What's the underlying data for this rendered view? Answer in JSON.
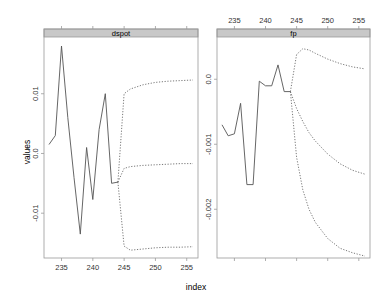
{
  "chart_data": [
    {
      "type": "line",
      "panel": "dspot",
      "xlabel": "index",
      "ylabel": "values",
      "xlim": [
        232.2,
        256.8
      ],
      "ylim": [
        -0.0175,
        0.0195
      ],
      "x_ticks": [
        235,
        240,
        245,
        250,
        255
      ],
      "x_tick_labels": [
        "235",
        "240",
        "245",
        "250",
        "255"
      ],
      "x_tick_side": "bottom",
      "y_ticks": [
        -0.01,
        0.0,
        0.01
      ],
      "y_tick_labels": [
        "-0.01",
        "0.0",
        "0.01"
      ],
      "series": [
        {
          "name": "observed",
          "style": "solid",
          "x": [
            233,
            234,
            235,
            236,
            237,
            238,
            239,
            240,
            241,
            242,
            243,
            244
          ],
          "values": [
            0.0015,
            0.003,
            0.018,
            0.006,
            -0.004,
            -0.0135,
            0.001,
            -0.0077,
            0.004,
            0.01,
            -0.005,
            -0.0048
          ]
        },
        {
          "name": "forecast-upper",
          "style": "dotted",
          "x": [
            244,
            245,
            246,
            248,
            250,
            252,
            254,
            256
          ],
          "values": [
            -0.0048,
            0.01,
            0.0108,
            0.0115,
            0.0119,
            0.0121,
            0.0122,
            0.0123
          ]
        },
        {
          "name": "forecast-mean",
          "style": "dotted",
          "x": [
            244,
            245,
            246,
            248,
            250,
            252,
            254,
            256
          ],
          "values": [
            -0.0048,
            -0.0025,
            -0.0022,
            -0.002,
            -0.0019,
            -0.0018,
            -0.0017,
            -0.0017
          ]
        },
        {
          "name": "forecast-lower",
          "style": "dotted",
          "x": [
            244,
            245,
            246,
            248,
            250,
            252,
            254,
            256
          ],
          "values": [
            -0.0048,
            -0.0155,
            -0.0162,
            -0.016,
            -0.0158,
            -0.0157,
            -0.0157,
            -0.0156
          ]
        }
      ]
    },
    {
      "type": "line",
      "panel": "fp",
      "xlabel": "index",
      "ylabel": "values",
      "xlim": [
        232.2,
        256.8
      ],
      "ylim": [
        -0.00275,
        0.00065
      ],
      "x_ticks": [
        235,
        240,
        245,
        250,
        255
      ],
      "x_tick_labels": [
        "235",
        "240",
        "245",
        "250",
        "255"
      ],
      "x_tick_side": "top",
      "y_ticks": [
        -0.002,
        -0.001,
        0.0
      ],
      "y_tick_labels": [
        "-0.002",
        "-0.001",
        "0.0"
      ],
      "series": [
        {
          "name": "observed",
          "style": "solid",
          "x": [
            233,
            234,
            235,
            236,
            237,
            238,
            239,
            240,
            241,
            242,
            243,
            244
          ],
          "values": [
            -0.0007,
            -0.00087,
            -0.00084,
            -0.00037,
            -0.00162,
            -0.00162,
            -3e-05,
            -0.0001,
            -0.0001,
            0.00022,
            -0.00019,
            -0.00019
          ]
        },
        {
          "name": "forecast-upper",
          "style": "dotted",
          "x": [
            244,
            245,
            246,
            247,
            248,
            250,
            252,
            254,
            256
          ],
          "values": [
            -0.00019,
            0.00038,
            0.00047,
            0.00045,
            0.0004,
            0.00031,
            0.00024,
            0.00019,
            0.00016
          ]
        },
        {
          "name": "forecast-mean",
          "style": "dotted",
          "x": [
            244,
            245,
            246,
            247,
            248,
            250,
            252,
            254,
            256
          ],
          "values": [
            -0.00019,
            -0.00045,
            -0.00065,
            -0.00082,
            -0.00095,
            -0.00115,
            -0.0013,
            -0.0014,
            -0.00146
          ]
        },
        {
          "name": "forecast-lower",
          "style": "dotted",
          "x": [
            244,
            245,
            246,
            247,
            248,
            250,
            252,
            254,
            256
          ],
          "values": [
            -0.00019,
            -0.0012,
            -0.0017,
            -0.002,
            -0.0022,
            -0.00245,
            -0.0026,
            -0.00267,
            -0.00272
          ]
        }
      ]
    }
  ],
  "labels": {
    "xlabel": "index",
    "ylabel": "values",
    "strip_left": "dspot",
    "strip_right": "fp"
  },
  "colors": {
    "strip": "#c8c8c8",
    "line": "#555555",
    "frame": "#9a9a9a"
  }
}
